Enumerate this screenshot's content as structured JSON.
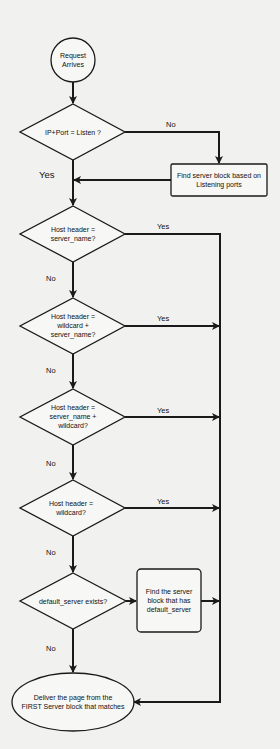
{
  "diagram": {
    "type": "flowchart",
    "title": "",
    "nodes": {
      "start": {
        "shape": "circle",
        "lines": [
          "Request",
          "Arrives"
        ]
      },
      "d1": {
        "shape": "diamond",
        "lines": [
          "IP+Port = Listen ?"
        ]
      },
      "box_listen": {
        "shape": "rect",
        "lines": [
          "Find server block based on",
          "Listening ports"
        ]
      },
      "d2": {
        "shape": "diamond",
        "lines": [
          "Host header =",
          "server_name?"
        ]
      },
      "d3": {
        "shape": "diamond",
        "lines": [
          "Host header =",
          "wildcard +",
          "server_name?"
        ]
      },
      "d4": {
        "shape": "diamond",
        "lines": [
          "Host header =",
          "server_name +",
          "wildcard?"
        ]
      },
      "d5": {
        "shape": "diamond",
        "lines": [
          "Host header =",
          "wildcard?"
        ]
      },
      "d6": {
        "shape": "diamond",
        "lines": [
          "default_server exists?"
        ]
      },
      "box_default": {
        "shape": "rounded-rect",
        "lines": [
          "Find the server",
          "block that has",
          "default_server"
        ]
      },
      "end": {
        "shape": "ellipse",
        "lines": [
          "Deliver the page from the",
          "FIRST Server block that matches"
        ]
      }
    },
    "edges": {
      "d1_no": "No",
      "d1_yes": "Yes",
      "d2_yes": "Yes",
      "d2_no": "No",
      "d3_yes": "Yes",
      "d3_no": "No",
      "d4_yes": "Yes",
      "d4_no": "No",
      "d5_yes": "Yes",
      "d5_no": "No",
      "d6_no": "No"
    },
    "colors": {
      "background": "#f1f1ef",
      "stroke": "#1a1a1a",
      "fill": "#f7f7f5"
    }
  }
}
